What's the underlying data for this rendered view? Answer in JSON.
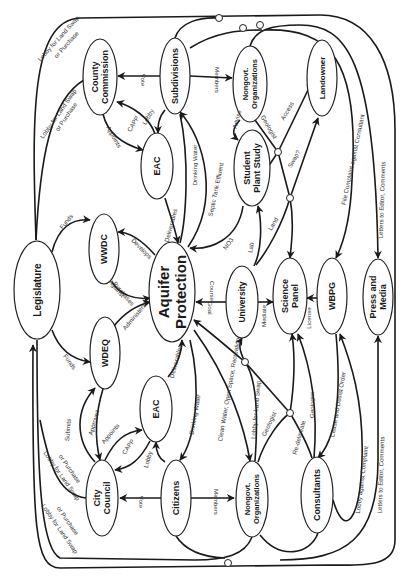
{
  "diagram": {
    "orientation": "rotated-90-clockwise",
    "nodes": [
      {
        "id": "aquifer",
        "lines": [
          "Aquifer",
          "Protection"
        ],
        "cx": 172,
        "cy": 292,
        "rx": 23,
        "ry": 50,
        "size": 15
      },
      {
        "id": "legislature",
        "lines": [
          "Legislature"
        ],
        "cx": 37,
        "cy": 290,
        "rx": 23,
        "ry": 49,
        "size": 10
      },
      {
        "id": "county",
        "lines": [
          "County",
          "Commission"
        ],
        "cx": 100,
        "cy": 77,
        "rx": 17,
        "ry": 38,
        "size": 9
      },
      {
        "id": "subdiv",
        "lines": [
          "Subdivisions"
        ],
        "cx": 175,
        "cy": 76,
        "rx": 15,
        "ry": 38,
        "size": 9
      },
      {
        "id": "ngo-top",
        "lines": [
          "Nongovt.",
          "Organizations"
        ],
        "cx": 250,
        "cy": 84,
        "rx": 17,
        "ry": 38,
        "size": 7.5
      },
      {
        "id": "landowner",
        "lines": [
          "Landowner"
        ],
        "cx": 322,
        "cy": 78,
        "rx": 15,
        "ry": 38,
        "size": 8
      },
      {
        "id": "eac-top",
        "lines": [
          "EAC"
        ],
        "cx": 157,
        "cy": 166,
        "rx": 16,
        "ry": 33,
        "size": 9
      },
      {
        "id": "student",
        "lines": [
          "Student",
          "Plant Study"
        ],
        "cx": 252,
        "cy": 168,
        "rx": 18,
        "ry": 38,
        "size": 9
      },
      {
        "id": "wwdc",
        "lines": [
          "WWDC"
        ],
        "cx": 104,
        "cy": 249,
        "rx": 15,
        "ry": 35,
        "size": 9
      },
      {
        "id": "university",
        "lines": [
          "University"
        ],
        "cx": 242,
        "cy": 302,
        "rx": 16,
        "ry": 36,
        "size": 8.5
      },
      {
        "id": "science",
        "lines": [
          "Science",
          "Panel"
        ],
        "cx": 290,
        "cy": 296,
        "rx": 17,
        "ry": 38,
        "size": 9
      },
      {
        "id": "wbpg",
        "lines": [
          "WBPG"
        ],
        "cx": 332,
        "cy": 296,
        "rx": 15,
        "ry": 38,
        "size": 9
      },
      {
        "id": "press",
        "lines": [
          "Press and",
          "Media"
        ],
        "cx": 378,
        "cy": 297,
        "rx": 15,
        "ry": 38,
        "size": 9
      },
      {
        "id": "wdeq",
        "lines": [
          "WDEQ"
        ],
        "cx": 105,
        "cy": 353,
        "rx": 15,
        "ry": 36,
        "size": 9
      },
      {
        "id": "eac-bot",
        "lines": [
          "EAC"
        ],
        "cx": 156,
        "cy": 409,
        "rx": 16,
        "ry": 33,
        "size": 9
      },
      {
        "id": "city",
        "lines": [
          "City",
          "Council"
        ],
        "cx": 102,
        "cy": 498,
        "rx": 16,
        "ry": 38,
        "size": 9
      },
      {
        "id": "citizens",
        "lines": [
          "Citizens"
        ],
        "cx": 176,
        "cy": 498,
        "rx": 15,
        "ry": 38,
        "size": 9
      },
      {
        "id": "ngo-bot",
        "lines": [
          "Nongovt.",
          "Organizations"
        ],
        "cx": 252,
        "cy": 499,
        "rx": 16,
        "ry": 38,
        "size": 7.5
      },
      {
        "id": "consultants",
        "lines": [
          "Consultants"
        ],
        "cx": 317,
        "cy": 495,
        "rx": 16,
        "ry": 38,
        "size": 9
      }
    ],
    "edge_labels": [
      {
        "text": "Lobby for Land Swap",
        "x": 60,
        "y": 40,
        "rot": -48
      },
      {
        "text": "or Purchase",
        "x": 68,
        "y": 46,
        "rot": -48
      },
      {
        "text": "Lobby for Land Swap",
        "x": 60,
        "y": 115,
        "rot": -55
      },
      {
        "text": "or Purchase",
        "x": 68,
        "y": 118,
        "rot": -55
      },
      {
        "text": "Vote",
        "x": 141,
        "y": 80,
        "rot": 90
      },
      {
        "text": "Members",
        "x": 215,
        "y": 80,
        "rot": 90
      },
      {
        "text": "Appoints",
        "x": 112,
        "y": 138,
        "rot": 60
      },
      {
        "text": "CAPP",
        "x": 135,
        "y": 125,
        "rot": -60
      },
      {
        "text": "Lobby",
        "x": 150,
        "y": 118,
        "rot": -60
      },
      {
        "text": "Drinking Water",
        "x": 197,
        "y": 165,
        "rot": -90
      },
      {
        "text": "Septic Tank Effluent",
        "x": 218,
        "y": 190,
        "rot": -78
      },
      {
        "text": "Deliverables",
        "x": 173,
        "y": 226,
        "rot": -75
      },
      {
        "text": "NO3",
        "x": 230,
        "y": 245,
        "rot": -55
      },
      {
        "text": "Advise",
        "x": 239,
        "y": 120,
        "rot": -75
      },
      {
        "text": "Geologist",
        "x": 267,
        "y": 128,
        "rot": 60
      },
      {
        "text": "Access",
        "x": 289,
        "y": 112,
        "rot": -60
      },
      {
        "text": "Swap?",
        "x": 296,
        "y": 160,
        "rot": -60
      },
      {
        "text": "Land",
        "x": 275,
        "y": 225,
        "rot": -60
      },
      {
        "text": "Lab",
        "x": 253,
        "y": 248,
        "rot": -80
      },
      {
        "text": "File Complaint against Consultant",
        "x": 355,
        "y": 160,
        "rot": -78
      },
      {
        "text": "Letters to Editor, Comments",
        "x": 384,
        "y": 200,
        "rot": -88
      },
      {
        "text": "Funds",
        "x": 68,
        "y": 223,
        "rot": -50
      },
      {
        "text": "Develops",
        "x": 140,
        "y": 250,
        "rot": 45
      },
      {
        "text": "Against",
        "x": 115,
        "y": 290,
        "rot": 50
      },
      {
        "text": "Purchases",
        "x": 122,
        "y": 295,
        "rot": 50
      },
      {
        "text": "Administers",
        "x": 136,
        "y": 318,
        "rot": -50
      },
      {
        "text": "Course",
        "x": 210,
        "y": 291,
        "rot": 90
      },
      {
        "text": "Goal",
        "x": 208,
        "y": 308,
        "rot": 90
      },
      {
        "text": "Mediate",
        "x": 266,
        "y": 316,
        "rot": -90
      },
      {
        "text": "License",
        "x": 311,
        "y": 318,
        "rot": -90
      },
      {
        "text": "Funds",
        "x": 68,
        "y": 363,
        "rot": 55
      },
      {
        "text": "Deliverables",
        "x": 178,
        "y": 362,
        "rot": -75
      },
      {
        "text": "Submits",
        "x": 70,
        "y": 430,
        "rot": -85
      },
      {
        "text": "Approves",
        "x": 96,
        "y": 423,
        "rot": -75
      },
      {
        "text": "Appoints",
        "x": 112,
        "y": 435,
        "rot": -50
      },
      {
        "text": "CAPP",
        "x": 130,
        "y": 448,
        "rot": -55
      },
      {
        "text": "Lobby",
        "x": 150,
        "y": 460,
        "rot": -75
      },
      {
        "text": "Drinking Water",
        "x": 197,
        "y": 415,
        "rot": -80
      },
      {
        "text": "Clean Water, Open Space, Recreation",
        "x": 231,
        "y": 390,
        "rot": -80
      },
      {
        "text": "Lobby for Land Swap",
        "x": 258,
        "y": 410,
        "rot": -85
      },
      {
        "text": "Geologist",
        "x": 271,
        "y": 425,
        "rot": -65
      },
      {
        "text": "Re-delineate",
        "x": 301,
        "y": 438,
        "rot": -75
      },
      {
        "text": "Geologist",
        "x": 314,
        "y": 405,
        "rot": -90
      },
      {
        "text": "Cease and Desist Order",
        "x": 340,
        "y": 405,
        "rot": -80
      },
      {
        "text": "Lobby against Complaint",
        "x": 364,
        "y": 480,
        "rot": -83
      },
      {
        "text": "Letters to Editor, Comments",
        "x": 383,
        "y": 475,
        "rot": -88
      },
      {
        "text": "Vote",
        "x": 139,
        "y": 502,
        "rot": 90
      },
      {
        "text": "Members",
        "x": 214,
        "y": 502,
        "rot": 90
      },
      {
        "text": "Lobby for Land Swap",
        "x": 60,
        "y": 477,
        "rot": 55
      },
      {
        "text": "or Purchase",
        "x": 68,
        "y": 470,
        "rot": 55
      },
      {
        "text": "Lobby for Land Swap",
        "x": 58,
        "y": 530,
        "rot": 55
      },
      {
        "text": "or Purchase",
        "x": 66,
        "y": 522,
        "rot": 55
      }
    ]
  }
}
